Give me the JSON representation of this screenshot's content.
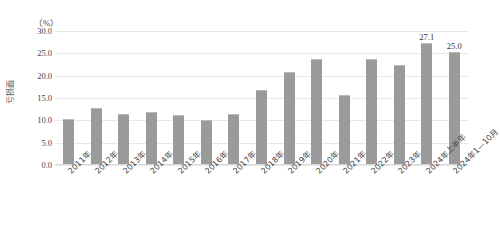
{
  "chart_data": {
    "type": "bar",
    "title": "",
    "subtitle": "",
    "unit_label": "（%）",
    "ylabel": "亏损面",
    "xlabel": "",
    "ylim": [
      0,
      30
    ],
    "ytick_labels": [
      "30.0",
      "25.0",
      "20.0",
      "15.0",
      "10.0",
      "5.0",
      "0.0"
    ],
    "ytick_values": [
      30.0,
      25.0,
      20.0,
      15.0,
      10.0,
      5.0,
      0.0
    ],
    "grid": true,
    "legend": "none",
    "bar_color": "#9a9a9a",
    "categories": [
      "2011年",
      "2012年",
      "2013年",
      "2014年",
      "2015年",
      "2016年",
      "2017年",
      "2018年",
      "2019年",
      "2020年",
      "2021年",
      "2022年",
      "2023年",
      "2024年上半年",
      "2024年1—10月"
    ],
    "values": [
      10.0,
      12.6,
      11.2,
      11.7,
      11.0,
      9.8,
      11.1,
      16.5,
      20.5,
      23.5,
      15.5,
      23.5,
      22.2,
      27.1,
      25.0
    ],
    "data_labels": [
      "",
      "",
      "",
      "",
      "",
      "",
      "",
      "",
      "",
      "",
      "",
      "",
      "",
      "27.1",
      "25.0"
    ]
  }
}
